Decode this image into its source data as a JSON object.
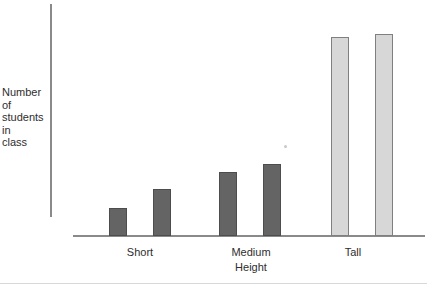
{
  "figure": {
    "background": "#ffffff"
  },
  "chart_data": {
    "type": "bar",
    "title": "",
    "xlabel": "Height",
    "ylabel": "Number of students in class",
    "ylabel_display": "Number\nof\nstudents\nin\nclass",
    "categories": [
      "Short",
      "Medium",
      "Tall"
    ],
    "series": [
      {
        "name": "left bar of pair",
        "values": [
          28,
          64,
          199
        ]
      },
      {
        "name": "right bar of pair",
        "values": [
          47,
          72,
          202
        ]
      }
    ],
    "value_note": "No numeric y-axis or gridlines shown; values are relative bar heights (screen px, baseline to top)",
    "grid": false,
    "legend": "none",
    "bar_fill": [
      "#646464",
      "#646464",
      "#d7d7d7"
    ],
    "bar_border": [
      "#4d4d4d",
      "#4d4d4d",
      "#7f7f7f"
    ],
    "axis_color": "#8a8a8a",
    "text_color": "#2e2e2e",
    "layout": {
      "baseline_y": 236,
      "group_centers_x": [
        140,
        250,
        362
      ],
      "label_centers_x": [
        140,
        251,
        353
      ],
      "bar_width": 18,
      "bar_gap": 26,
      "xlabel_center_x": 251
    }
  }
}
